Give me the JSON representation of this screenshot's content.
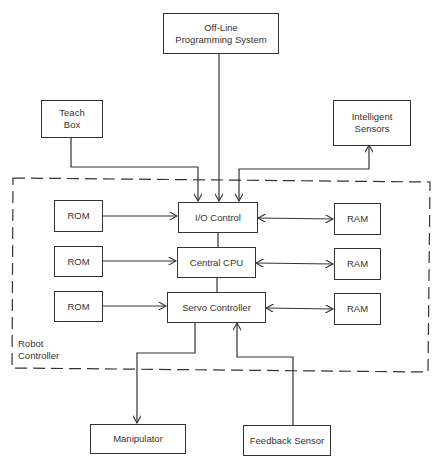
{
  "diagram": {
    "type": "block-diagram",
    "external": {
      "offline_programming": "Off-Line\nProgramming System",
      "teach_box": "Teach\nBox",
      "intelligent_sensors": "Intelligent\nSensors",
      "manipulator": "Manipulator",
      "feedback_sensor": "Feedback Sensor"
    },
    "controller": {
      "label": "Robot\nController",
      "io_control": "I/O Control",
      "central_cpu": "Central CPU",
      "servo_controller": "Servo Controller",
      "rom": [
        "ROM",
        "ROM",
        "ROM"
      ],
      "ram": [
        "RAM",
        "RAM",
        "RAM"
      ]
    },
    "connections": [
      {
        "from": "Off-Line Programming System",
        "to": "I/O Control",
        "arrow": "to"
      },
      {
        "from": "Teach Box",
        "to": "I/O Control",
        "arrow": "to"
      },
      {
        "from": "I/O Control",
        "to": "Intelligent Sensors",
        "arrow": "both"
      },
      {
        "from": "ROM",
        "to": "I/O Control",
        "arrow": "to"
      },
      {
        "from": "ROM",
        "to": "Central CPU",
        "arrow": "to"
      },
      {
        "from": "ROM",
        "to": "Servo Controller",
        "arrow": "to"
      },
      {
        "from": "I/O Control",
        "to": "RAM",
        "arrow": "both"
      },
      {
        "from": "Central CPU",
        "to": "RAM",
        "arrow": "both"
      },
      {
        "from": "Servo Controller",
        "to": "RAM",
        "arrow": "both"
      },
      {
        "from": "I/O Control",
        "to": "Central CPU",
        "arrow": "none"
      },
      {
        "from": "Central CPU",
        "to": "Servo Controller",
        "arrow": "none"
      },
      {
        "from": "Servo Controller",
        "to": "Manipulator",
        "arrow": "to"
      },
      {
        "from": "Feedback Sensor",
        "to": "Servo Controller",
        "arrow": "to"
      }
    ]
  }
}
